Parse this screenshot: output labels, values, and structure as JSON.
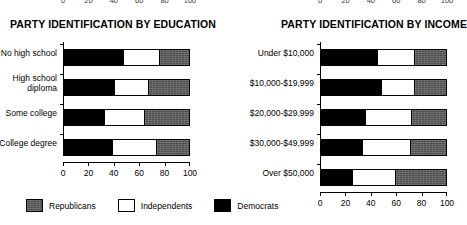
{
  "top_clipped_axis": {
    "note_visible_text": "partial tick labels clipped at top edge",
    "left_ticks": [
      "0",
      "20",
      "40",
      "60",
      "80",
      "100"
    ],
    "right_ticks": [
      "0",
      "20",
      "40",
      "60",
      "80",
      "100"
    ]
  },
  "legend": {
    "items": [
      {
        "label": "Republicans",
        "swatch": "republican-swatch",
        "color": "#4d4d4d"
      },
      {
        "label": "Independents",
        "swatch": "independent-swatch",
        "color": "#ffffff"
      },
      {
        "label": "Democrats",
        "swatch": "democrat-swatch",
        "color": "#000000"
      }
    ]
  },
  "chart_data": [
    {
      "type": "bar",
      "orientation": "horizontal",
      "stacked": true,
      "title": "PARTY IDENTIFICATION BY EDUCATION",
      "xlabel": "",
      "ylabel": "",
      "xlim": [
        0,
        100
      ],
      "xticks": [
        0,
        20,
        40,
        60,
        80,
        100
      ],
      "xtick_labels": [
        "0",
        "20",
        "40",
        "60",
        "80",
        "100"
      ],
      "grid": false,
      "legend_position": "bottom-shared",
      "categories": [
        "No high school",
        "High school diploma",
        "Some college",
        "College degree"
      ],
      "series": [
        {
          "name": "Democrats",
          "color": "#000000",
          "values": [
            47,
            40,
            32,
            38
          ]
        },
        {
          "name": "Independents",
          "color": "#ffffff",
          "values": [
            30,
            28,
            33,
            36
          ]
        },
        {
          "name": "Republicans",
          "color": "#4d4d4d",
          "values": [
            23,
            32,
            35,
            26
          ]
        }
      ]
    },
    {
      "type": "bar",
      "orientation": "horizontal",
      "stacked": true,
      "title": "PARTY IDENTIFICATION BY INCOME",
      "xlabel": "",
      "ylabel": "",
      "xlim": [
        0,
        100
      ],
      "xticks": [
        0,
        20,
        40,
        60,
        80,
        100
      ],
      "xtick_labels": [
        "0",
        "20",
        "40",
        "60",
        "80",
        "100"
      ],
      "grid": false,
      "legend_position": "bottom-shared",
      "categories": [
        "Under $10,000",
        "$10,000-$19,999",
        "$20,000-$29,999",
        "$30,000-$49,999",
        "Over $50,000"
      ],
      "series": [
        {
          "name": "Democrats",
          "color": "#000000",
          "values": [
            45,
            48,
            35,
            33,
            25
          ]
        },
        {
          "name": "Independents",
          "color": "#ffffff",
          "values": [
            30,
            27,
            38,
            39,
            35
          ]
        },
        {
          "name": "Republicans",
          "color": "#4d4d4d",
          "values": [
            25,
            25,
            27,
            28,
            40
          ]
        }
      ]
    }
  ]
}
